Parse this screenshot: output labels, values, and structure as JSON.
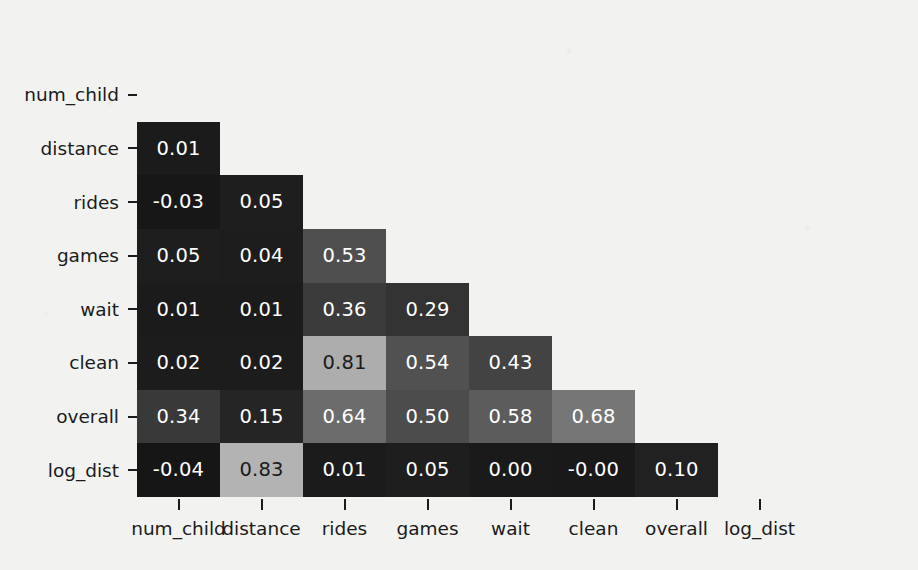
{
  "chart_data": {
    "type": "heatmap",
    "title": "",
    "subtitle": "",
    "xlabel": "",
    "ylabel": "",
    "colormap": "grayscale",
    "mask": "lower-triangle",
    "grid": false,
    "legend": "none",
    "annotated": true,
    "value_format": "0.2f",
    "vmin": -0.04,
    "vmax": 1.0,
    "x_categories": [
      "num_child",
      "distance",
      "rides",
      "games",
      "wait",
      "clean",
      "overall",
      "log_dist"
    ],
    "y_categories": [
      "num_child",
      "distance",
      "rides",
      "games",
      "wait",
      "clean",
      "overall",
      "log_dist"
    ],
    "rows": [
      {
        "label": "num_child",
        "cells": []
      },
      {
        "label": "distance",
        "cells": [
          {
            "col": "num_child",
            "value": 0.01,
            "text": "0.01",
            "fill": "#1b1b1b",
            "ink": "#ffffff"
          }
        ]
      },
      {
        "label": "rides",
        "cells": [
          {
            "col": "num_child",
            "value": -0.03,
            "text": "-0.03",
            "fill": "#171717",
            "ink": "#ffffff"
          },
          {
            "col": "distance",
            "value": 0.05,
            "text": "0.05",
            "fill": "#1e1e1e",
            "ink": "#ffffff"
          }
        ]
      },
      {
        "label": "games",
        "cells": [
          {
            "col": "num_child",
            "value": 0.05,
            "text": "0.05",
            "fill": "#1e1e1e",
            "ink": "#ffffff"
          },
          {
            "col": "distance",
            "value": 0.04,
            "text": "0.04",
            "fill": "#1d1d1d",
            "ink": "#ffffff"
          },
          {
            "col": "rides",
            "value": 0.53,
            "text": "0.53",
            "fill": "#4f4f4f",
            "ink": "#ffffff"
          }
        ]
      },
      {
        "label": "wait",
        "cells": [
          {
            "col": "num_child",
            "value": 0.01,
            "text": "0.01",
            "fill": "#1b1b1b",
            "ink": "#ffffff"
          },
          {
            "col": "distance",
            "value": 0.01,
            "text": "0.01",
            "fill": "#1b1b1b",
            "ink": "#ffffff"
          },
          {
            "col": "rides",
            "value": 0.36,
            "text": "0.36",
            "fill": "#3b3b3b",
            "ink": "#ffffff"
          },
          {
            "col": "games",
            "value": 0.29,
            "text": "0.29",
            "fill": "#333333",
            "ink": "#ffffff"
          }
        ]
      },
      {
        "label": "clean",
        "cells": [
          {
            "col": "num_child",
            "value": 0.02,
            "text": "0.02",
            "fill": "#1c1c1c",
            "ink": "#ffffff"
          },
          {
            "col": "distance",
            "value": 0.02,
            "text": "0.02",
            "fill": "#1c1c1c",
            "ink": "#ffffff"
          },
          {
            "col": "rides",
            "value": 0.81,
            "text": "0.81",
            "fill": "#adadad",
            "ink": "#1b1b1b"
          },
          {
            "col": "games",
            "value": 0.54,
            "text": "0.54",
            "fill": "#515151",
            "ink": "#ffffff"
          },
          {
            "col": "wait",
            "value": 0.43,
            "text": "0.43",
            "fill": "#434343",
            "ink": "#ffffff"
          }
        ]
      },
      {
        "label": "overall",
        "cells": [
          {
            "col": "num_child",
            "value": 0.34,
            "text": "0.34",
            "fill": "#393939",
            "ink": "#ffffff"
          },
          {
            "col": "distance",
            "value": 0.15,
            "text": "0.15",
            "fill": "#252525",
            "ink": "#ffffff"
          },
          {
            "col": "rides",
            "value": 0.64,
            "text": "0.64",
            "fill": "#6c6c6c",
            "ink": "#ffffff"
          },
          {
            "col": "games",
            "value": 0.5,
            "text": "0.50",
            "fill": "#4c4c4c",
            "ink": "#ffffff"
          },
          {
            "col": "wait",
            "value": 0.58,
            "text": "0.58",
            "fill": "#5c5c5c",
            "ink": "#ffffff"
          },
          {
            "col": "clean",
            "value": 0.68,
            "text": "0.68",
            "fill": "#767676",
            "ink": "#ffffff"
          }
        ]
      },
      {
        "label": "log_dist",
        "cells": [
          {
            "col": "num_child",
            "value": -0.04,
            "text": "-0.04",
            "fill": "#161616",
            "ink": "#ffffff"
          },
          {
            "col": "distance",
            "value": 0.83,
            "text": "0.83",
            "fill": "#b3b3b3",
            "ink": "#1b1b1b"
          },
          {
            "col": "rides",
            "value": 0.01,
            "text": "0.01",
            "fill": "#1b1b1b",
            "ink": "#ffffff"
          },
          {
            "col": "games",
            "value": 0.05,
            "text": "0.05",
            "fill": "#1e1e1e",
            "ink": "#ffffff"
          },
          {
            "col": "wait",
            "value": 0.0,
            "text": "0.00",
            "fill": "#1a1a1a",
            "ink": "#ffffff"
          },
          {
            "col": "clean",
            "value": -0.0,
            "text": "-0.00",
            "fill": "#191919",
            "ink": "#ffffff"
          },
          {
            "col": "overall",
            "value": 0.1,
            "text": "0.10",
            "fill": "#212121",
            "ink": "#ffffff"
          }
        ]
      }
    ]
  },
  "figure": {
    "background_color": "#f2f2f0",
    "tick_color": "#1b1b1b"
  }
}
